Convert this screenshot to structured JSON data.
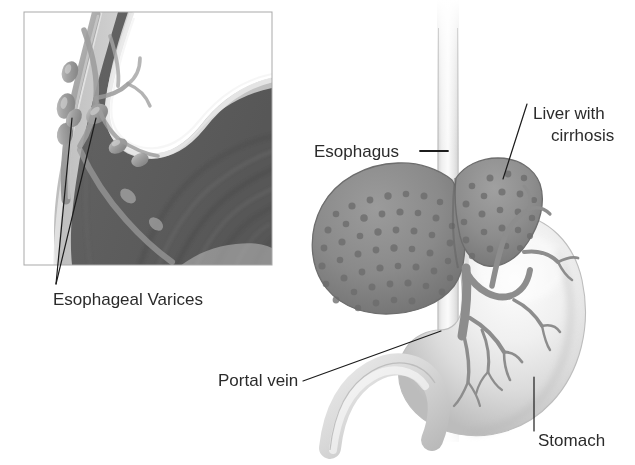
{
  "figure": {
    "type": "medical-illustration",
    "style": "grayscale anatomical drawing",
    "width": 635,
    "height": 465,
    "background_color": "#ffffff"
  },
  "colors": {
    "label_text": "#2b2b2b",
    "leader_line": "#1a1a1a",
    "inset_border": "#a8a8a8",
    "mucosa_dark": "#5f5f5f",
    "mucosa_mid": "#767676",
    "mucosa_light": "#8d8d8d",
    "wall_pale": "#c9c9c9",
    "wall_highlight": "#e3e3e3",
    "varix_fill": "#9a9a9a",
    "varix_highlight": "#bdbdbd",
    "liver_fill": "#8a8a8a",
    "liver_nodule": "#6e6e6e",
    "liver_edge": "#6a6a6a",
    "stomach_light": "#f2f2f2",
    "stomach_shade": "#c4c4c4",
    "vein_stroke": "#8b8b8b",
    "esophagus_tube": "#ededed",
    "esophagus_tube_shade": "#d5d5d5"
  },
  "inset": {
    "name": "esophagus-varices-closeup",
    "description": "Magnified cutaway of the lower esophagus showing dilated submucosal veins",
    "border": {
      "x": 24,
      "y": 12,
      "width": 248,
      "height": 253
    }
  },
  "labels": [
    {
      "id": "esophageal-varices",
      "text": "Esophageal Varices",
      "x": 53,
      "y": 305,
      "anchor": "start",
      "lines": [
        "Esophageal Varices"
      ],
      "font_size": 17,
      "leaders": [
        {
          "x1": 56,
          "y1": 284,
          "x2": 72,
          "y2": 118
        },
        {
          "x1": 56,
          "y1": 284,
          "x2": 96,
          "y2": 118
        }
      ]
    },
    {
      "id": "esophagus",
      "text": "Esophagus",
      "x": 314,
      "y": 157,
      "anchor": "start",
      "lines": [
        "Esophagus"
      ],
      "font_size": 17,
      "leaders": [
        {
          "x1": 420,
          "y1": 151,
          "x2": 448,
          "y2": 151
        }
      ]
    },
    {
      "id": "liver-with-cirrhosis",
      "text": "Liver with cirrhosis",
      "x": 533,
      "y": 119,
      "anchor": "start",
      "lines": [
        "Liver with",
        "cirrhosis"
      ],
      "font_size": 17,
      "line_height": 22,
      "leaders": [
        {
          "x1": 527,
          "y1": 104,
          "x2": 503,
          "y2": 179
        }
      ]
    },
    {
      "id": "portal-vein",
      "text": "Portal vein",
      "x": 218,
      "y": 386,
      "anchor": "start",
      "lines": [
        "Portal vein"
      ],
      "font_size": 17,
      "leaders": [
        {
          "x1": 303,
          "y1": 381,
          "x2": 441,
          "y2": 331
        }
      ]
    },
    {
      "id": "stomach",
      "text": "Stomach",
      "x": 538,
      "y": 446,
      "anchor": "start",
      "lines": [
        "Stomach"
      ],
      "font_size": 17,
      "leaders": [
        {
          "x1": 534,
          "y1": 431,
          "x2": 534,
          "y2": 377
        }
      ]
    }
  ],
  "anatomy": {
    "esophagus_tube": {
      "name": "esophagus",
      "top_y": 0,
      "bottom_y": 440,
      "center_x": 448,
      "width": 20
    },
    "liver": {
      "name": "liver-with-cirrhosis",
      "lobes": 2,
      "surface": "nodular",
      "nodule_count": 96
    },
    "stomach": {
      "name": "stomach",
      "shading": "pale-gradient"
    },
    "portal_vein": {
      "name": "portal-vein",
      "branching": "tree"
    },
    "varices": {
      "name": "esophageal-varices",
      "count": 7,
      "location": "submucosal lower esophagus"
    }
  }
}
